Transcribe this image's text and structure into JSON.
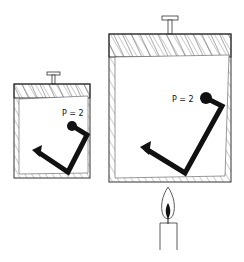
{
  "diagram": {
    "small_container": {
      "label": "P = 2"
    },
    "large_container": {
      "label": "P = 2"
    },
    "heat_source": "candle-icon"
  },
  "colors": {
    "ink": "#111111",
    "background": "#ffffff"
  }
}
